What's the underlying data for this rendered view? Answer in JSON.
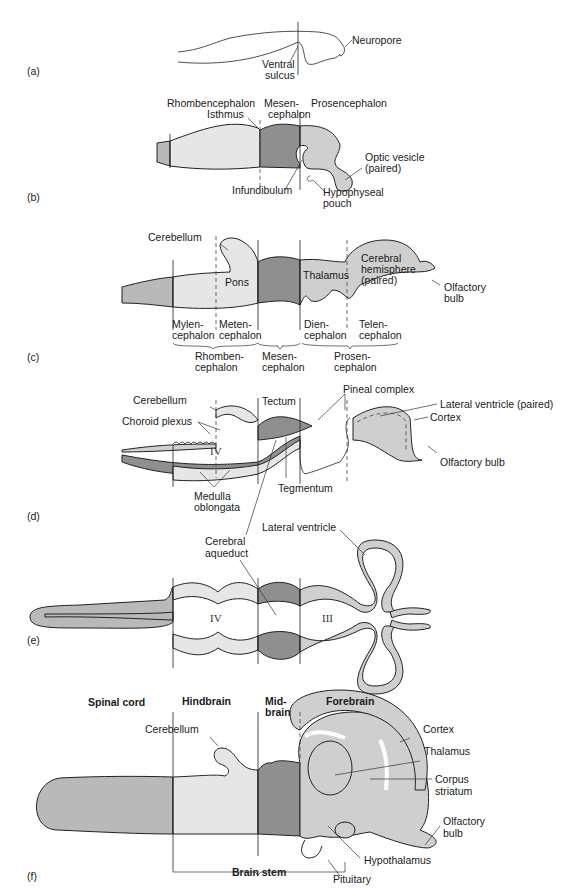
{
  "colors": {
    "spinal": "#b9b9b9",
    "hind": "#e6e6e6",
    "mid": "#8f8f8f",
    "fore": "#cfcfcf",
    "outline": "#222222"
  },
  "panels": {
    "a": {
      "tag": "(a)",
      "labels": {
        "neuropore": "Neuropore",
        "ventral1": "Ventral",
        "ventral2": "sulcus"
      }
    },
    "b": {
      "tag": "(b)",
      "labels": {
        "rhomb": "Rhombencephalon",
        "mesen1": "Mesen-",
        "mesen2": "cephalon",
        "prosen": "Prosencephalon",
        "isthmus": "Isthmus",
        "optic1": "Optic vesicle",
        "optic2": "(paired)",
        "infund": "Infundibulum",
        "hypo1": "Hypophyseal",
        "hypo2": "pouch"
      }
    },
    "c": {
      "tag": "(c)",
      "labels": {
        "cerebellum": "Cerebellum",
        "pons": "Pons",
        "thalamus": "Thalamus",
        "cereb1": "Cerebral",
        "cereb2": "hemisphere",
        "cereb3": "(paired)",
        "olf1": "Olfactory",
        "olf2": "bulb",
        "mylen1": "Mylen-",
        "mylen2": "cephalon",
        "meten1": "Meten-",
        "meten2": "cephalon",
        "dien1": "Dien-",
        "dien2": "cephalon",
        "telen1": "Telen-",
        "telen2": "cephalon",
        "rhomb1": "Rhomben-",
        "rhomb2": "cephalon",
        "mes1": "Mesen-",
        "mes2": "cephalon",
        "pros1": "Prosen-",
        "pros2": "cephalon"
      }
    },
    "d": {
      "tag": "(d)",
      "labels": {
        "cerebellum": "Cerebellum",
        "tectum": "Tectum",
        "pineal": "Pineal complex",
        "latvent": "Lateral ventricle (paired)",
        "cortex": "Cortex",
        "choroid": "Choroid plexus",
        "iv": "IV",
        "olf": "Olfactory bulb",
        "tegmentum": "Tegmentum",
        "medulla1": "Medulla",
        "medulla2": "oblongata"
      }
    },
    "e": {
      "tag": "(e)",
      "labels": {
        "latvent": "Lateral ventricle",
        "aq1": "Cerebral",
        "aq2": "aqueduct",
        "iv": "IV",
        "iii": "III"
      }
    },
    "f": {
      "tag": "(f)",
      "labels": {
        "spinal": "Spinal cord",
        "hind": "Hindbrain",
        "mid1": "Mid-",
        "mid2": "brain",
        "fore": "Forebrain",
        "cerebellum": "Cerebellum",
        "cortex": "Cortex",
        "thalamus": "Thalamus",
        "corpus1": "Corpus",
        "corpus2": "striatum",
        "olf1": "Olfactory",
        "olf2": "bulb",
        "hypothal": "Hypothalamus",
        "brainstem": "Brain stem",
        "pituitary": "Pituitary"
      }
    }
  }
}
